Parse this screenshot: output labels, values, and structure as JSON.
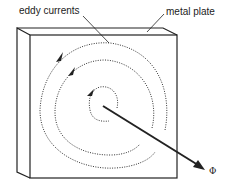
{
  "diagram": {
    "title": "",
    "labels": {
      "eddy_currents": "eddy currents",
      "metal_plate": "metal plate",
      "flux": "Φ"
    },
    "elements": [
      {
        "id": "metal-plate",
        "type": "box-3d",
        "description": "Thick rectangular metal plate shown in oblique projection"
      },
      {
        "id": "eddy-current-spiral-outer",
        "type": "dotted-arc",
        "direction": "anticlockwise",
        "arrow": true
      },
      {
        "id": "eddy-current-spiral-middle",
        "type": "dotted-arc",
        "direction": "anticlockwise",
        "arrow": true
      },
      {
        "id": "eddy-current-spiral-inner",
        "type": "dotted-arc",
        "direction": "anticlockwise",
        "arrow": true
      },
      {
        "id": "flux-arrow",
        "type": "arrow",
        "label": "Φ",
        "description": "Magnetic flux direction through the plate"
      }
    ],
    "colors": {
      "line": "#222222",
      "background": "#ffffff"
    }
  }
}
